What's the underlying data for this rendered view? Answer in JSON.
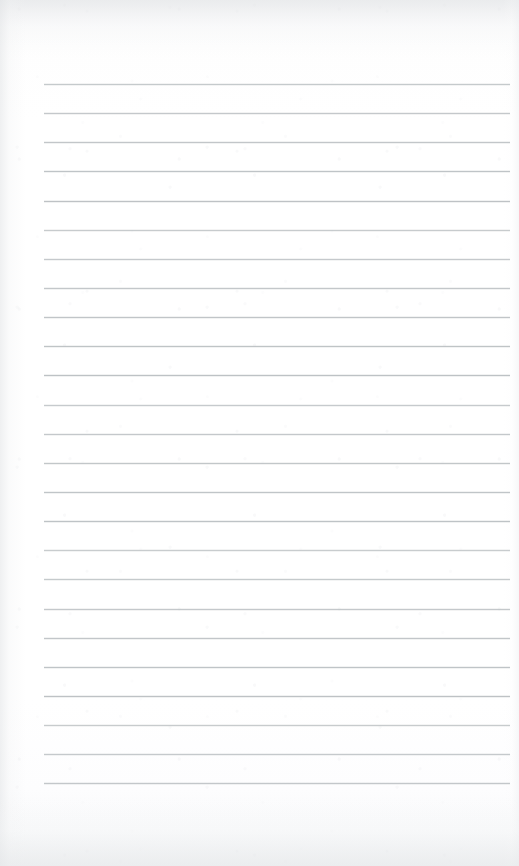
{
  "document": {
    "type": "lined-notebook-page",
    "title": "Blank ruled notepad page",
    "content_text": "",
    "has_handwriting": false,
    "has_printed_text": false,
    "page_width": 519,
    "page_height": 866
  },
  "paper": {
    "background_color": "#fdfdfd",
    "edge_tint_color": "#e8eaec",
    "texture": "faint-scan-grain"
  },
  "ruling": {
    "line_color": "#bcc0c4",
    "line_thickness_px": 1,
    "line_count": 25,
    "line_spacing_px": 29.1,
    "first_line_y": 84,
    "last_line_y": 783,
    "left_margin_x": 44,
    "right_margin_x": 510,
    "line_length_px": 466,
    "top_blank_area_px": 84,
    "bottom_blank_area_px": 83,
    "lines": [
      {
        "index": 1,
        "y": 84,
        "text": ""
      },
      {
        "index": 2,
        "y": 113,
        "text": ""
      },
      {
        "index": 3,
        "y": 142,
        "text": ""
      },
      {
        "index": 4,
        "y": 171,
        "text": ""
      },
      {
        "index": 5,
        "y": 201,
        "text": ""
      },
      {
        "index": 6,
        "y": 230,
        "text": ""
      },
      {
        "index": 7,
        "y": 259,
        "text": ""
      },
      {
        "index": 8,
        "y": 288,
        "text": ""
      },
      {
        "index": 9,
        "y": 317,
        "text": ""
      },
      {
        "index": 10,
        "y": 346,
        "text": ""
      },
      {
        "index": 11,
        "y": 375,
        "text": ""
      },
      {
        "index": 12,
        "y": 405,
        "text": ""
      },
      {
        "index": 13,
        "y": 434,
        "text": ""
      },
      {
        "index": 14,
        "y": 463,
        "text": ""
      },
      {
        "index": 15,
        "y": 492,
        "text": ""
      },
      {
        "index": 16,
        "y": 521,
        "text": ""
      },
      {
        "index": 17,
        "y": 550,
        "text": ""
      },
      {
        "index": 18,
        "y": 579,
        "text": ""
      },
      {
        "index": 19,
        "y": 609,
        "text": ""
      },
      {
        "index": 20,
        "y": 638,
        "text": ""
      },
      {
        "index": 21,
        "y": 667,
        "text": ""
      },
      {
        "index": 22,
        "y": 696,
        "text": ""
      },
      {
        "index": 23,
        "y": 725,
        "text": ""
      },
      {
        "index": 24,
        "y": 754,
        "text": ""
      },
      {
        "index": 25,
        "y": 783,
        "text": ""
      }
    ]
  }
}
